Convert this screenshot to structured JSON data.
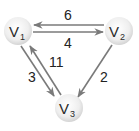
{
  "graph": {
    "type": "directed-weighted",
    "colors": {
      "edge": "#7a7a7a",
      "node_fill_center": "#ffffff",
      "node_fill_edge": "#d9d9d9",
      "text": "#2a2a2a"
    },
    "nodes": [
      {
        "id": "V1",
        "letter": "V",
        "sub": "1",
        "x": 18,
        "y": 31
      },
      {
        "id": "V2",
        "letter": "V",
        "sub": "2",
        "x": 119,
        "y": 31
      },
      {
        "id": "V3",
        "letter": "V",
        "sub": "3",
        "x": 69,
        "y": 108
      }
    ],
    "edges": [
      {
        "from": "V2",
        "to": "V1",
        "weight": "6"
      },
      {
        "from": "V1",
        "to": "V2",
        "weight": "4"
      },
      {
        "from": "V1",
        "to": "V3",
        "weight": "3"
      },
      {
        "from": "V3",
        "to": "V1",
        "weight": "11"
      },
      {
        "from": "V2",
        "to": "V3",
        "weight": "2"
      }
    ]
  }
}
